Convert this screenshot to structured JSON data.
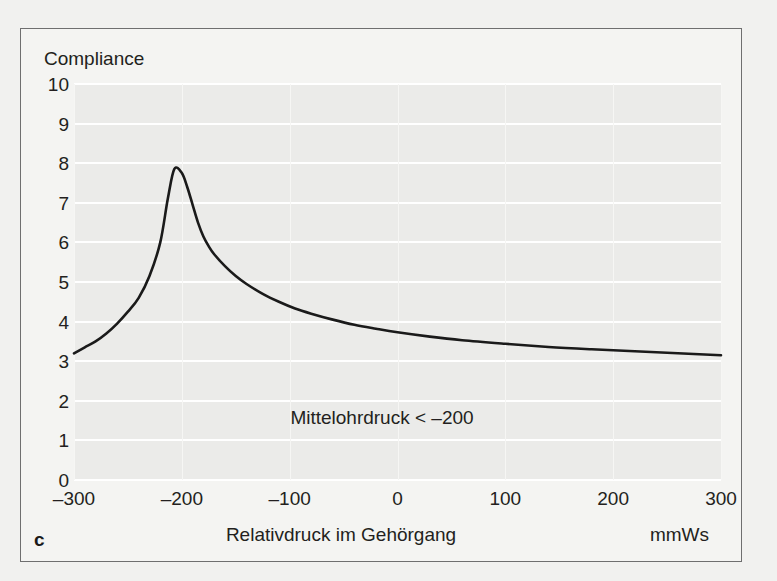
{
  "figure": {
    "panel_label": "c",
    "annotation": "Mittelohrdruck < –200"
  },
  "chart_data": {
    "type": "line",
    "title": "",
    "ylabel": "Compliance",
    "xlabel": "Relativdruck im Gehörgang",
    "xunit": "mmWs",
    "xlim": [
      -300,
      300
    ],
    "ylim": [
      0,
      10
    ],
    "grid": true,
    "legend": "none",
    "xticks": [
      "–300",
      "–200",
      "–100",
      "0",
      "100",
      "200",
      "300"
    ],
    "xtick_values": [
      -300,
      -200,
      -100,
      0,
      100,
      200,
      300
    ],
    "yticks": [
      "10",
      "9",
      "8",
      "7",
      "6",
      "5",
      "4",
      "3",
      "2",
      "1",
      "0"
    ],
    "ytick_values": [
      10,
      9,
      8,
      7,
      6,
      5,
      4,
      3,
      2,
      1,
      0
    ],
    "series": [
      {
        "name": "Tympanogram Typ C",
        "color": "#1a1a1a",
        "x": [
          -300,
          -290,
          -280,
          -270,
          -260,
          -250,
          -240,
          -230,
          -220,
          -213,
          -207,
          -200,
          -195,
          -190,
          -185,
          -180,
          -175,
          -170,
          -160,
          -150,
          -140,
          -125,
          -110,
          -95,
          -80,
          -60,
          -40,
          -20,
          0,
          30,
          60,
          100,
          140,
          180,
          220,
          260,
          300
        ],
        "y": [
          3.2,
          3.35,
          3.5,
          3.7,
          3.95,
          4.25,
          4.6,
          5.15,
          6.0,
          7.1,
          7.85,
          7.75,
          7.4,
          6.95,
          6.5,
          6.15,
          5.9,
          5.7,
          5.4,
          5.15,
          4.95,
          4.7,
          4.5,
          4.33,
          4.2,
          4.05,
          3.92,
          3.82,
          3.73,
          3.62,
          3.53,
          3.44,
          3.36,
          3.3,
          3.25,
          3.2,
          3.15
        ],
        "peak": {
          "x": -207,
          "y": 7.85
        }
      }
    ]
  }
}
